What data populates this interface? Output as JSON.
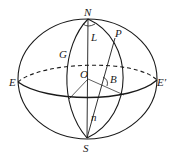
{
  "diagram": {
    "type": "celestial-sphere",
    "colors": {
      "stroke": "#1a1a1a",
      "background": "#ffffff"
    },
    "labels": {
      "N": "N",
      "S": "S",
      "E": "E",
      "E_prime": "E′",
      "O": "O",
      "G": "G",
      "P": "P",
      "L": "L",
      "B": "B",
      "n": "n"
    },
    "points": {
      "N": [
        88,
        19
      ],
      "S": [
        87,
        138
      ],
      "E": [
        18,
        82
      ],
      "E_prime": [
        157,
        80
      ],
      "O": [
        88,
        79
      ],
      "G": [
        68,
        57
      ],
      "P": [
        115,
        38
      ],
      "equator_left": [
        69,
        99
      ],
      "equator_right": [
        124,
        95
      ]
    }
  }
}
